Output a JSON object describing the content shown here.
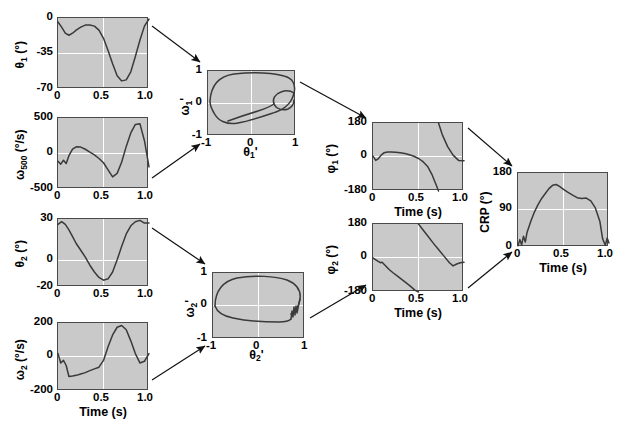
{
  "figure": {
    "background": "#ffffff",
    "plot_face_color": "#c9c9c9",
    "grid_color": "#ffffff",
    "curve_color": "#3a3a3a",
    "axis_color": "#4a4a4a"
  },
  "labels": {
    "time_axis": "Time (s)",
    "theta1": "θ",
    "theta1_sub": "1",
    "deg_unit": "(°)",
    "degps_unit": "(°/s)",
    "omega": "ω",
    "phi": "φ",
    "crp": "CRP",
    "prime": "'"
  },
  "chart_data": [
    {
      "id": "theta1-time",
      "type": "line",
      "title": "",
      "xlabel": "",
      "ylabel": "θ1 (°)",
      "xlim": [
        0,
        1.0
      ],
      "ylim": [
        -70,
        0
      ],
      "xticks": [
        "0",
        "0.5",
        "1.0"
      ],
      "xtick_values": [
        0,
        0.5,
        1.0
      ],
      "yticks": [
        "0",
        "-35",
        "-70"
      ],
      "ytick_values": [
        0,
        -35,
        -70
      ],
      "grid": true,
      "x": [
        0.0,
        0.04,
        0.08,
        0.12,
        0.16,
        0.2,
        0.25,
        0.3,
        0.35,
        0.4,
        0.45,
        0.5,
        0.55,
        0.6,
        0.65,
        0.7,
        0.75,
        0.8,
        0.85,
        0.9,
        0.95,
        1.0
      ],
      "values": [
        -4,
        -9,
        -15,
        -17,
        -15,
        -12,
        -9,
        -7,
        -7,
        -8,
        -12,
        -20,
        -32,
        -45,
        -57,
        -62,
        -61,
        -53,
        -38,
        -22,
        -8,
        -1
      ]
    },
    {
      "id": "omega1-time",
      "type": "line",
      "title": "",
      "xlabel": "",
      "ylabel": "ω1 (°/s)",
      "xlim": [
        0,
        1.0
      ],
      "ylim": [
        -500,
        500
      ],
      "xticks": [
        "0",
        "0.5",
        "1.0"
      ],
      "xtick_values": [
        0,
        0.5,
        1.0
      ],
      "yticks": [
        "500",
        "0",
        "-500"
      ],
      "ytick_values": [
        500,
        0,
        -500
      ],
      "grid": true,
      "x": [
        0.0,
        0.03,
        0.06,
        0.09,
        0.12,
        0.16,
        0.2,
        0.25,
        0.3,
        0.35,
        0.4,
        0.45,
        0.5,
        0.55,
        0.6,
        0.65,
        0.7,
        0.75,
        0.8,
        0.85,
        0.9,
        0.95,
        1.0
      ],
      "values": [
        -110,
        -150,
        -95,
        -140,
        -30,
        60,
        95,
        90,
        60,
        20,
        -20,
        -70,
        -130,
        -230,
        -330,
        -280,
        -120,
        100,
        290,
        410,
        420,
        180,
        -190
      ]
    },
    {
      "id": "phase-portrait-1",
      "type": "line",
      "title": "",
      "xlabel": "θ1'",
      "ylabel": "ω1'",
      "xlim": [
        -1,
        1
      ],
      "ylim": [
        -1,
        1
      ],
      "xticks": [
        "-1",
        "0",
        "1"
      ],
      "xtick_values": [
        -1,
        0,
        1
      ],
      "yticks": [
        "1",
        "0",
        "-1"
      ],
      "ytick_values": [
        1,
        0,
        -1
      ],
      "grid": true,
      "description": "Normalized phase portrait: large closed orbit with small inner loop at right"
    },
    {
      "id": "phi1-time",
      "type": "line",
      "title": "",
      "xlabel": "Time (s)",
      "ylabel": "φ1 (°)",
      "xlim": [
        0,
        1.0
      ],
      "ylim": [
        -180,
        180
      ],
      "xticks": [
        "0",
        "0.5",
        "1.0"
      ],
      "xtick_values": [
        0,
        0.5,
        1.0
      ],
      "yticks": [
        "180",
        "0",
        "-180"
      ],
      "ytick_values": [
        180,
        0,
        -180
      ],
      "grid": true,
      "x": [
        0.0,
        0.03,
        0.06,
        0.09,
        0.12,
        0.16,
        0.2,
        0.25,
        0.3,
        0.35,
        0.4,
        0.45,
        0.5,
        0.55,
        0.6,
        0.65,
        0.7,
        0.72,
        0.72,
        0.76,
        0.82,
        0.88,
        0.94,
        1.0
      ],
      "values": [
        5,
        -18,
        -8,
        10,
        22,
        26,
        27,
        25,
        22,
        18,
        12,
        4,
        -8,
        -25,
        -50,
        -95,
        -155,
        -180,
        180,
        120,
        55,
        10,
        -18,
        -20
      ]
    },
    {
      "id": "theta2-time",
      "type": "line",
      "title": "",
      "xlabel": "",
      "ylabel": "θ2 (°)",
      "xlim": [
        0,
        1.0
      ],
      "ylim": [
        -20,
        30
      ],
      "xticks": [
        "0",
        "0.5",
        "1.0"
      ],
      "xtick_values": [
        0,
        0.5,
        1.0
      ],
      "yticks": [
        "30",
        "0",
        "-20"
      ],
      "ytick_values": [
        30,
        0,
        -20
      ],
      "grid": true,
      "x": [
        0.0,
        0.04,
        0.08,
        0.12,
        0.16,
        0.2,
        0.25,
        0.3,
        0.35,
        0.4,
        0.45,
        0.5,
        0.55,
        0.6,
        0.65,
        0.7,
        0.75,
        0.8,
        0.85,
        0.9,
        0.95,
        1.0
      ],
      "values": [
        26,
        28,
        26,
        22,
        17,
        12,
        7,
        2,
        -4,
        -9,
        -13,
        -15,
        -14,
        -9,
        0,
        10,
        19,
        25,
        28,
        29,
        27,
        27
      ]
    },
    {
      "id": "omega2-time",
      "type": "line",
      "title": "",
      "xlabel": "Time (s)",
      "ylabel": "ω2 (°/s)",
      "xlim": [
        0,
        1.0
      ],
      "ylim": [
        -200,
        200
      ],
      "xticks": [
        "0",
        "0.5",
        "1.0"
      ],
      "xtick_values": [
        0,
        0.5,
        1.0
      ],
      "yticks": [
        "200",
        "0",
        "-200"
      ],
      "ytick_values": [
        200,
        0,
        -200
      ],
      "grid": true,
      "x": [
        0.0,
        0.03,
        0.06,
        0.09,
        0.12,
        0.16,
        0.2,
        0.25,
        0.3,
        0.35,
        0.4,
        0.45,
        0.5,
        0.55,
        0.6,
        0.65,
        0.7,
        0.75,
        0.8,
        0.85,
        0.9,
        0.95,
        1.0
      ],
      "values": [
        20,
        -35,
        -20,
        -50,
        -115,
        -112,
        -108,
        -100,
        -92,
        -80,
        -70,
        -60,
        -20,
        60,
        130,
        175,
        185,
        160,
        95,
        20,
        -35,
        -25,
        20
      ]
    },
    {
      "id": "phase-portrait-2",
      "type": "line",
      "title": "",
      "xlabel": "θ2'",
      "ylabel": "ω2'",
      "xlim": [
        -1,
        1
      ],
      "ylim": [
        -1,
        1
      ],
      "xticks": [
        "-1",
        "0",
        "1"
      ],
      "xtick_values": [
        -1,
        0,
        1
      ],
      "yticks": [
        "1",
        "0",
        "-1"
      ],
      "ytick_values": [
        1,
        0,
        -1
      ],
      "grid": true,
      "description": "Normalized phase portrait: broad flattened closed orbit with jagged notch at right"
    },
    {
      "id": "phi2-time",
      "type": "line",
      "title": "",
      "xlabel": "Time (s)",
      "ylabel": "φ2 (°)",
      "xlim": [
        0,
        1.0
      ],
      "ylim": [
        -180,
        180
      ],
      "xticks": [
        "0",
        "0.5",
        "1.0"
      ],
      "xtick_values": [
        0,
        0.5,
        1.0
      ],
      "yticks": [
        "180",
        "0",
        "-180"
      ],
      "ytick_values": [
        180,
        0,
        -180
      ],
      "grid": true,
      "x": [
        0.0,
        0.04,
        0.08,
        0.1,
        0.14,
        0.18,
        0.22,
        0.28,
        0.34,
        0.4,
        0.46,
        0.5,
        0.5,
        0.54,
        0.6,
        0.66,
        0.72,
        0.78,
        0.84,
        0.88,
        0.92,
        0.96,
        1.0
      ],
      "values": [
        0,
        -12,
        -25,
        -22,
        -42,
        -62,
        -78,
        -100,
        -122,
        -145,
        -170,
        -180,
        180,
        155,
        118,
        80,
        45,
        10,
        -25,
        -42,
        -32,
        -25,
        -22
      ]
    },
    {
      "id": "crp-time",
      "type": "line",
      "title": "",
      "xlabel": "Time (s)",
      "ylabel": "CRP (°)",
      "xlim": [
        0,
        1.0
      ],
      "ylim": [
        0,
        180
      ],
      "xticks": [
        "0",
        "0.5",
        "1.0"
      ],
      "xtick_values": [
        0,
        0.5,
        1.0
      ],
      "yticks": [
        "180",
        "90",
        "0"
      ],
      "ytick_values": [
        180,
        90,
        0
      ],
      "grid": true,
      "x": [
        0.0,
        0.02,
        0.04,
        0.06,
        0.08,
        0.1,
        0.14,
        0.18,
        0.22,
        0.26,
        0.3,
        0.34,
        0.38,
        0.42,
        0.46,
        0.5,
        0.55,
        0.6,
        0.65,
        0.7,
        0.75,
        0.8,
        0.85,
        0.9,
        0.93,
        0.96,
        0.98,
        1.0
      ],
      "values": [
        3,
        18,
        5,
        26,
        12,
        36,
        62,
        85,
        103,
        118,
        130,
        142,
        150,
        152,
        147,
        140,
        133,
        126,
        120,
        118,
        119,
        112,
        95,
        62,
        20,
        4,
        22,
        10
      ]
    }
  ],
  "arrows": [
    {
      "name": "theta1-to-portrait1",
      "from": "theta1-time",
      "to": "phase-portrait-1"
    },
    {
      "name": "omega1-to-portrait1",
      "from": "omega1-time",
      "to": "phase-portrait-1"
    },
    {
      "name": "portrait1-to-phi1",
      "from": "phase-portrait-1",
      "to": "phi1-time"
    },
    {
      "name": "theta2-to-portrait2",
      "from": "theta2-time",
      "to": "phase-portrait-2"
    },
    {
      "name": "omega2-to-portrait2",
      "from": "omega2-time",
      "to": "phase-portrait-2"
    },
    {
      "name": "portrait2-to-phi2",
      "from": "phase-portrait-2",
      "to": "phi2-time"
    },
    {
      "name": "phi1-to-crp",
      "from": "phi1-time",
      "to": "crp-time"
    },
    {
      "name": "phi2-to-crp",
      "from": "phi2-time",
      "to": "crp-time"
    }
  ]
}
